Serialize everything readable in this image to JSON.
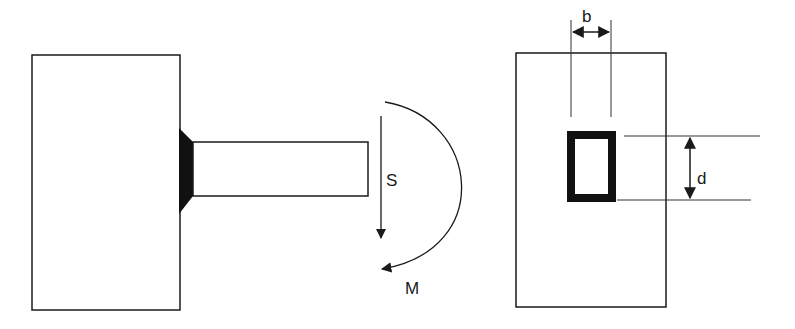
{
  "diagram": {
    "type": "engineering-sketch",
    "left_view": {
      "description": "Cantilever beam welded to a support block",
      "labels": {
        "shear": "S",
        "moment": "M"
      }
    },
    "right_view": {
      "description": "Cross-section showing hollow rectangular section on support face",
      "labels": {
        "width": "b",
        "depth": "d"
      }
    },
    "colors": {
      "line": "#1a1a1a",
      "fill": "#ffffff",
      "weld": "#111111"
    }
  }
}
